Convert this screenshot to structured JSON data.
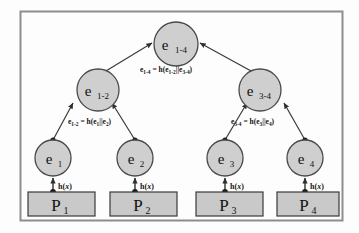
{
  "figure": {
    "border_color": "#8d8d8d",
    "background": "#fdfdfd",
    "node_fill": "#cfcfcf",
    "node_stroke": "#4a4a4a",
    "box_fill": "#c9c9c9",
    "box_stroke": "#3a3a3a",
    "edge_color": "#3a3a3a"
  },
  "nodes": {
    "root": {
      "name": "e",
      "sub": "1-4"
    },
    "internal": [
      {
        "name": "e",
        "sub": "1-2"
      },
      {
        "name": "e",
        "sub": "3-4"
      }
    ],
    "leaves": [
      {
        "name": "e",
        "sub": "1"
      },
      {
        "name": "e",
        "sub": "2"
      },
      {
        "name": "e",
        "sub": "3"
      },
      {
        "name": "e",
        "sub": "4"
      }
    ]
  },
  "data_blocks": [
    {
      "name": "P",
      "sub": "1"
    },
    {
      "name": "P",
      "sub": "2"
    },
    {
      "name": "P",
      "sub": "3"
    },
    {
      "name": "P",
      "sub": "4"
    }
  ],
  "equations": {
    "root": {
      "lhs": "e",
      "lhs_sub": "1-4",
      "op": " = h(e",
      "arg1_sub": "1-2",
      "mid": "||e",
      "arg2_sub": "3-4",
      "close": ")",
      "full": "e1-4 = h(e1-2||e3-4)"
    },
    "left": {
      "lhs": "e",
      "lhs_sub": "1-2",
      "op": " = h(e",
      "arg1_sub": "1",
      "mid": "||e",
      "arg2_sub": "2",
      "close": ")",
      "full": "e1-2 = h(e1||e2)"
    },
    "right": {
      "lhs": "e",
      "lhs_sub": "3-4",
      "op": " = h(e",
      "arg1_sub": "3",
      "mid": "||e",
      "arg2_sub": "4",
      "close": ")",
      "full": "e3-4 = h(e3||e4)"
    }
  },
  "hash_edges": [
    {
      "label_prefix": "h(",
      "label_var": "x",
      "label_suffix": ")"
    },
    {
      "label_prefix": "h(",
      "label_var": "x",
      "label_suffix": ")"
    },
    {
      "label_prefix": "h(",
      "label_var": "x",
      "label_suffix": ")"
    },
    {
      "label_prefix": "h(",
      "label_var": "x",
      "label_suffix": ")"
    }
  ]
}
